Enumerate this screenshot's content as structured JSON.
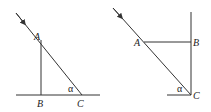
{
  "figures": [
    {
      "id": "left",
      "labels": {
        "A": "A",
        "B": "B",
        "C": "C",
        "angle": "α"
      }
    },
    {
      "id": "right",
      "labels": {
        "A": "A",
        "B": "B",
        "C": "C",
        "angle": "α"
      }
    }
  ],
  "colors": {
    "line": "#333333",
    "text": "#222222",
    "background": "#ffffff"
  }
}
